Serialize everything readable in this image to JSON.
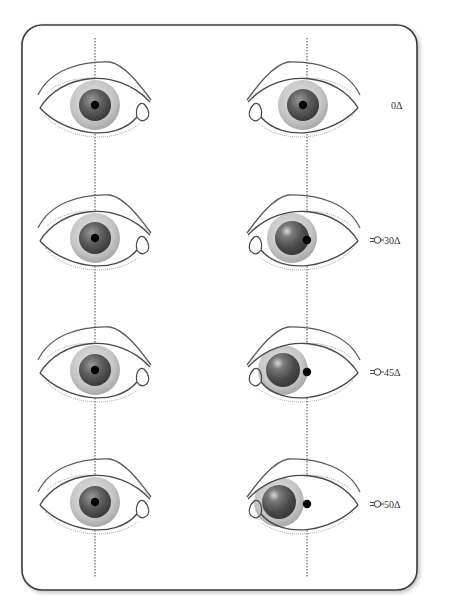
{
  "figure": {
    "title": "",
    "colors": {
      "frame": "#3a3a3a",
      "eyelid_stroke": "#555555",
      "iris_outer": "#c8c8c8",
      "iris_inner": "#5a5a5a",
      "pupil": "#000000",
      "reference_line": "#444444"
    },
    "rows": [
      {
        "label": "0Δ",
        "prism_icon": false,
        "deviation": 0
      },
      {
        "label": "30Δ",
        "prism_icon": true,
        "deviation": 30
      },
      {
        "label": "45Δ",
        "prism_icon": true,
        "deviation": 45
      },
      {
        "label": "50Δ",
        "prism_icon": true,
        "deviation": 50
      }
    ],
    "prism_icon_name": "prism-icon"
  }
}
